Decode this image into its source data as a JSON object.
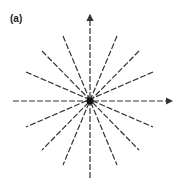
{
  "figure": {
    "panel_label": "(a)",
    "center": [
      90,
      101
    ],
    "x_axis": {
      "from": [
        13,
        101
      ],
      "to": [
        172,
        101
      ]
    },
    "y_axis": {
      "from": [
        90,
        178
      ],
      "to": [
        90,
        15
      ]
    },
    "rays": [
      {
        "from": [
          63,
          36
        ],
        "to": [
          117,
          165
        ]
      },
      {
        "from": [
          117,
          36
        ],
        "to": [
          63,
          165
        ]
      },
      {
        "from": [
          42,
          51
        ],
        "to": [
          139,
          150
        ]
      },
      {
        "from": [
          139,
          51
        ],
        "to": [
          42,
          150
        ]
      },
      {
        "from": [
          26,
          72
        ],
        "to": [
          153,
          127
        ]
      },
      {
        "from": [
          153,
          72
        ],
        "to": [
          26,
          127
        ]
      }
    ],
    "line_color": "#333333",
    "dash": "6 2"
  }
}
